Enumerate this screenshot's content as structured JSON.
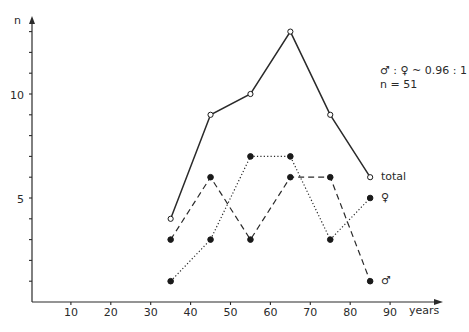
{
  "chart_data": {
    "type": "line",
    "title": "",
    "xlabel": "years",
    "ylabel": "n",
    "x": [
      35,
      45,
      55,
      65,
      75,
      85
    ],
    "series": [
      {
        "name": "total",
        "style": "solid",
        "marker": "open-circle",
        "values": [
          4,
          9,
          10,
          13,
          9,
          6
        ]
      },
      {
        "name": "♀",
        "style": "dotted",
        "marker": "filled-circle",
        "values": [
          1,
          3,
          7,
          7,
          3,
          5
        ]
      },
      {
        "name": "♂",
        "style": "dashed",
        "marker": "filled-circle",
        "values": [
          3,
          6,
          3,
          6,
          6,
          1
        ]
      }
    ],
    "xticks": [
      10,
      20,
      30,
      40,
      50,
      60,
      70,
      80,
      90
    ],
    "yticks_labeled": [
      5,
      10
    ],
    "yticks_minor": [
      1,
      2,
      3,
      4,
      6,
      7,
      8,
      9,
      11,
      12,
      13
    ],
    "xlim": [
      0,
      97
    ],
    "ylim": [
      0,
      14.5
    ],
    "grid": false,
    "legend": "inline labels at line ends",
    "annotations": [
      "♂ : ♀ ~ 0.96 : 1",
      "n = 51"
    ]
  },
  "labels": {
    "y_axis": "n",
    "x_axis": "years",
    "ratio": "♂ : ♀ ~ 0.96 : 1",
    "count": "n = 51",
    "total": "total",
    "female": "♀",
    "male": "♂",
    "ytick_10": "10",
    "ytick_5": "5",
    "xt": [
      "10",
      "20",
      "30",
      "40",
      "50",
      "60",
      "70",
      "80",
      "90"
    ]
  }
}
